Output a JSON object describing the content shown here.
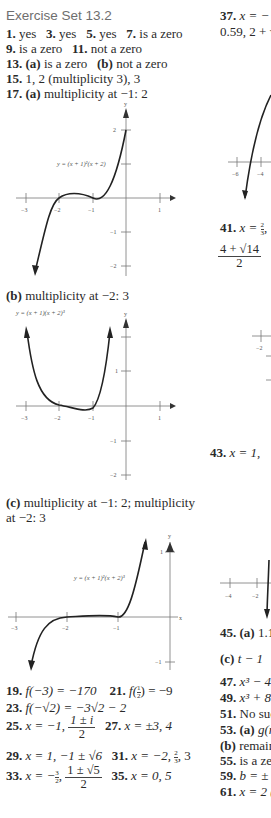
{
  "left_column": {
    "heading": "Exercise Set 13.2",
    "lines": [
      {
        "items": [
          {
            "num": "1.",
            "text": "yes"
          },
          {
            "num": "3.",
            "text": "yes"
          },
          {
            "num": "5.",
            "text": "yes"
          },
          {
            "num": "7.",
            "text": "is a zero"
          }
        ]
      },
      {
        "items": [
          {
            "num": "9.",
            "text": "is a zero"
          },
          {
            "num": "11.",
            "text": "not a zero"
          }
        ]
      },
      {
        "items": [
          {
            "num": "13.",
            "text": "(a)",
            "after": "is a zero"
          },
          {
            "num": "(b)",
            "text": "not a zero"
          }
        ]
      },
      {
        "items": [
          {
            "num": "15.",
            "text": "1, 2 (multiplicity 3), 3"
          }
        ]
      },
      {
        "items": [
          {
            "num": "17.",
            "text": "(a)",
            "after": "multiplicity at −1: 2"
          }
        ]
      }
    ],
    "part_b_label": "(b)",
    "part_b_text": "multiplicity at −2: 3",
    "part_c_label": "(c)",
    "part_c_text_line1": "multiplicity at −1: 2; multiplicity",
    "part_c_text_line2": "at −2: 3",
    "answers": {
      "a19_num": "19.",
      "a19": "f(−3) = −170",
      "a21_num": "21.",
      "a21_pre": "f(",
      "a21_frac_top": "1",
      "a21_frac_bot": "2",
      "a21_post": ") = −9",
      "a23_num": "23.",
      "a23": "f(−√2) = −3√2 − 2",
      "a25_num": "25.",
      "a25_pre": "x = −1,",
      "a25_frac_top": "1 ± i",
      "a25_frac_bot": "2",
      "a27_num": "27.",
      "a27": "x = ±3, 4",
      "a29_num": "29.",
      "a29": "x = 1, −1 ± √6",
      "a31_num": "31.",
      "a31_pre": "x = −2,",
      "a31_frac_top": "2",
      "a31_frac_bot": "3",
      "a31_post": ", 3",
      "a33_num": "33.",
      "a33_pre": "x = −",
      "a33_sfrac_top": "3",
      "a33_sfrac_bot": "2",
      "a33_mid": ",",
      "a33_frac_top": "1 ± √5",
      "a33_frac_bot": "2",
      "a35_num": "35.",
      "a35": "x = 0, 5"
    }
  },
  "graphs": {
    "graph_a": {
      "equation": "y = (x + 1)²(x + 2)",
      "axis_y_label": "y",
      "x_ticks": [
        "−3",
        "−2",
        "−1",
        "1"
      ],
      "y_ticks": [
        "2",
        "−1",
        "−2"
      ]
    },
    "graph_b": {
      "equation": "y = (x + 1)(x + 2)³",
      "axis_y_label": "y",
      "x_ticks": [
        "−3",
        "−2",
        "−1",
        "1"
      ],
      "y_ticks": [
        "1",
        "−1",
        "−2"
      ]
    },
    "graph_c": {
      "equation": "y = (x + 1)²(x + 2)³",
      "axis_y_label": "y",
      "axis_x_label": "x",
      "x_ticks": [
        "−3",
        "−2",
        "−1"
      ],
      "y_ticks": [
        "1",
        "−1"
      ]
    }
  },
  "right_column": {
    "a37_num": "37.",
    "a37_line1": "x = −",
    "a37_line2": "0.59, 2 + √",
    "graph37_x_ticks": [
      "−6",
      "−4"
    ],
    "a41_num": "41.",
    "a41_pre": "x = ",
    "a41_sfrac_top": "2",
    "a41_sfrac_bot": "3",
    "a41_post": ",",
    "a41_frac_top": "4 + √14",
    "a41_frac_bot": "2",
    "graph41_x_ticks": [
      "−2"
    ],
    "a43_num": "43.",
    "a43": "x = 1,",
    "graph43_x_ticks": [
      "−4",
      "−2"
    ],
    "a45_num": "45.",
    "a45_label": "(a)",
    "a45": "1.1",
    "a45c_label": "(c)",
    "a45c": "t − 1",
    "a47_num": "47.",
    "a47": "x³ − 4",
    "a49_num": "49.",
    "a49": "x³ + 8",
    "a51_num": "51.",
    "a51": "No suc",
    "a53_num": "53.",
    "a53_label": "(a)",
    "a53": "g(r",
    "a53b_label": "(b)",
    "a53b": "remain",
    "a55_num": "55.",
    "a55": "is a zer",
    "a59_num": "59.",
    "a59": "b = ±",
    "a61_num": "61.",
    "a61": "x = 2 ("
  }
}
